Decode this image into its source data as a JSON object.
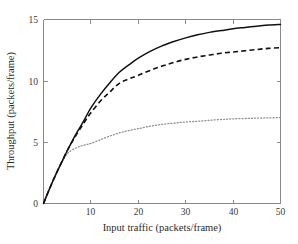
{
  "chart_data": {
    "type": "line",
    "title": "",
    "xlabel": "Input traffic (packets/frame)",
    "ylabel": "Throughput (packets/frame)",
    "xlim": [
      0,
      50
    ],
    "ylim": [
      0,
      15
    ],
    "xticks": [
      10,
      20,
      30,
      40,
      50
    ],
    "yticks": [
      0,
      5,
      10,
      15
    ],
    "xtick_labels": [
      "10",
      "20",
      "30",
      "40",
      "50"
    ],
    "ytick_labels": [
      "0",
      "5",
      "10",
      "15"
    ],
    "grid": false,
    "legend": "none",
    "x": [
      0,
      1,
      2,
      3,
      4,
      5,
      6,
      7,
      8,
      9,
      10,
      12,
      14,
      16,
      18,
      20,
      22.5,
      25,
      27.5,
      30,
      32.5,
      35,
      37.5,
      40,
      42.5,
      45,
      47.5,
      50
    ],
    "series": [
      {
        "name": "solid-curve",
        "style": "solid",
        "color": "#111111",
        "values": [
          0,
          0.95,
          1.85,
          2.7,
          3.5,
          4.3,
          5.05,
          5.75,
          6.4,
          7.1,
          7.8,
          8.9,
          9.85,
          10.7,
          11.3,
          11.85,
          12.4,
          12.85,
          13.2,
          13.5,
          13.75,
          13.95,
          14.1,
          14.25,
          14.35,
          14.45,
          14.55,
          14.6
        ]
      },
      {
        "name": "dashed-curve",
        "style": "dashed",
        "color": "#111111",
        "values": [
          0,
          0.95,
          1.85,
          2.7,
          3.5,
          4.3,
          5.0,
          5.65,
          6.25,
          6.85,
          7.4,
          8.35,
          9.1,
          9.8,
          10.15,
          10.45,
          10.85,
          11.2,
          11.5,
          11.75,
          11.95,
          12.1,
          12.25,
          12.35,
          12.45,
          12.55,
          12.65,
          12.7
        ]
      },
      {
        "name": "dotted-curve",
        "style": "dotted",
        "color": "#8e8e8e",
        "values": [
          0,
          0.95,
          1.85,
          2.7,
          3.45,
          4.05,
          4.35,
          4.55,
          4.7,
          4.8,
          4.9,
          5.2,
          5.5,
          5.75,
          5.95,
          6.1,
          6.3,
          6.45,
          6.55,
          6.65,
          6.7,
          6.78,
          6.85,
          6.9,
          6.93,
          6.96,
          6.98,
          7.0
        ]
      }
    ]
  }
}
